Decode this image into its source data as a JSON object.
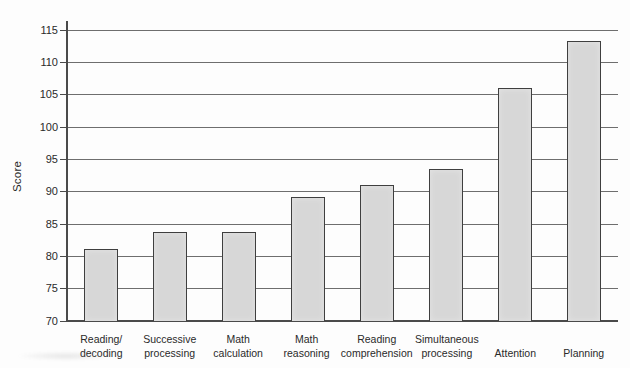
{
  "chart_data": {
    "type": "bar",
    "title": "",
    "xlabel": "",
    "ylabel": "Score",
    "categories": [
      "Reading/decoding",
      "Successive processing",
      "Math calculation",
      "Math reasoning",
      "Reading comprehension",
      "Simultaneous processing",
      "Attention",
      "Planning"
    ],
    "category_lines": [
      [
        "Reading/",
        "decoding"
      ],
      [
        "Successive",
        "processing"
      ],
      [
        "Math",
        "calculation"
      ],
      [
        "Math",
        "reasoning"
      ],
      [
        "Reading",
        "comprehension"
      ],
      [
        "Simultaneous",
        "processing"
      ],
      [
        "Attention"
      ],
      [
        "Planning"
      ]
    ],
    "values": [
      81.2,
      83.7,
      83.8,
      89.2,
      91.1,
      93.5,
      106.0,
      113.3
    ],
    "ylim": [
      70,
      115
    ],
    "yticks": [
      70,
      75,
      80,
      85,
      90,
      95,
      100,
      105,
      110,
      115
    ],
    "grid": true,
    "legend": "none",
    "colors": {
      "bar_fill": "#d7d7d7",
      "bar_border": "#3f3f3f",
      "grid_line": "#6e6e6e",
      "axis_line": "#4a4a4a",
      "text": "#2a2a2a",
      "background": "#fdfdfd"
    }
  }
}
